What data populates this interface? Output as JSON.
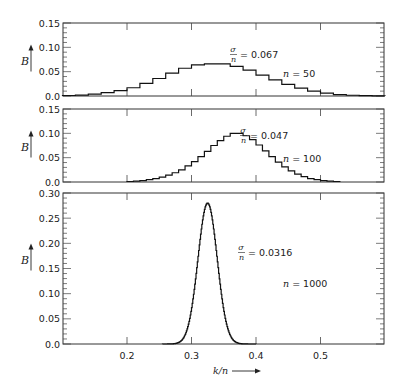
{
  "chart_data": [
    {
      "type": "line",
      "style": "step",
      "panel": 1,
      "ylabel": "B",
      "ylim": [
        0,
        0.15
      ],
      "yticks": [
        "0.0",
        "0.05",
        "0.10",
        "0.15"
      ],
      "xlim": [
        0.1,
        0.598
      ],
      "annotation_sigma": "= 0.067",
      "annotation_n": "n = 50",
      "n": 50,
      "bins_start": 0.1,
      "bin_width": 0.02,
      "values": [
        0.001,
        0.002,
        0.004,
        0.007,
        0.011,
        0.017,
        0.026,
        0.036,
        0.047,
        0.057,
        0.064,
        0.066,
        0.066,
        0.061,
        0.053,
        0.043,
        0.033,
        0.024,
        0.016,
        0.01,
        0.006,
        0.003,
        0.0015,
        0.0007,
        0.0003
      ]
    },
    {
      "type": "line",
      "style": "step",
      "panel": 2,
      "ylabel": "B",
      "ylim": [
        0,
        0.15
      ],
      "yticks": [
        "0.0",
        "0.05",
        "0.10",
        "0.15"
      ],
      "xlim": [
        0.1,
        0.598
      ],
      "annotation_sigma": "= 0.047",
      "annotation_n": "n = 100",
      "n": 100,
      "bins_start": 0.2,
      "bin_width": 0.01,
      "values": [
        0.001,
        0.002,
        0.003,
        0.005,
        0.007,
        0.01,
        0.014,
        0.019,
        0.025,
        0.033,
        0.042,
        0.052,
        0.063,
        0.075,
        0.085,
        0.094,
        0.1,
        0.1,
        0.095,
        0.087,
        0.076,
        0.064,
        0.052,
        0.041,
        0.031,
        0.023,
        0.016,
        0.011,
        0.007,
        0.005,
        0.003,
        0.002,
        0.001
      ]
    },
    {
      "type": "line",
      "style": "step",
      "panel": 3,
      "ylabel": "B",
      "xlabel": "k/n",
      "ylim": [
        0,
        0.3
      ],
      "yticks": [
        "0.0",
        "0.05",
        "0.10",
        "0.15",
        "0.20",
        "0.25",
        "0.30"
      ],
      "xlim": [
        0.1,
        0.598
      ],
      "xticks": [
        "0.2",
        "0.3",
        "0.4",
        "0.5"
      ],
      "annotation_sigma": "= 0.0316",
      "annotation_n": "n = 1000",
      "n": 1000,
      "peak": 0.28,
      "center": 0.325,
      "sigma_over_n": 0.0149,
      "range": [
        0.255,
        0.4
      ]
    }
  ],
  "labels": {
    "y_axis": "B",
    "x_axis": "k/n",
    "sigma_num": "σ",
    "sigma_den": "n"
  }
}
